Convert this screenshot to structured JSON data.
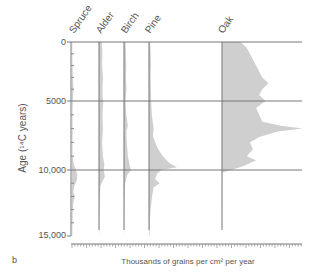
{
  "chart_data": {
    "type": "area",
    "title": "",
    "panel_label": "b",
    "xlabel": "Thousands of grains per cm² per year",
    "ylabel": "Age (¹⁴C years)",
    "y_ticks": [
      "0",
      "5000",
      "10,000",
      "15,000"
    ],
    "ylim": [
      0,
      15000
    ],
    "y_inverted": true,
    "grid": "horizontal lines at 0, 5000, 10,000",
    "fill_color": "#cfcfcf",
    "line_color": "#777777",
    "series": [
      {
        "name": "Spruce",
        "points": [
          [
            0,
            0.2
          ],
          [
            1000,
            0.2
          ],
          [
            2000,
            0.3
          ],
          [
            3000,
            0.5
          ],
          [
            4000,
            1.0
          ],
          [
            5000,
            0.5
          ],
          [
            6000,
            0.3
          ],
          [
            7000,
            0.4
          ],
          [
            8000,
            0.3
          ],
          [
            9000,
            0.4
          ],
          [
            9600,
            1.2
          ],
          [
            10000,
            2.5
          ],
          [
            10400,
            3.5
          ],
          [
            10800,
            3.0
          ],
          [
            11200,
            1.5
          ],
          [
            11700,
            0.8
          ],
          [
            12000,
            2.0
          ],
          [
            12400,
            1.0
          ],
          [
            13000,
            0.5
          ],
          [
            14000,
            0.3
          ],
          [
            15000,
            0.2
          ]
        ]
      },
      {
        "name": "Alder",
        "points": [
          [
            0,
            1.8
          ],
          [
            1000,
            2.2
          ],
          [
            2000,
            2.0
          ],
          [
            3000,
            2.6
          ],
          [
            4000,
            2.2
          ],
          [
            4800,
            2.4
          ],
          [
            5000,
            2.8
          ],
          [
            6000,
            2.2
          ],
          [
            7000,
            2.5
          ],
          [
            8000,
            2.0
          ],
          [
            9000,
            2.5
          ],
          [
            9600,
            3.5
          ],
          [
            10000,
            3.0
          ],
          [
            10500,
            3.8
          ],
          [
            10800,
            2.5
          ],
          [
            11200,
            1.0
          ],
          [
            12000,
            0.5
          ],
          [
            13000,
            0.3
          ],
          [
            14000,
            0.2
          ],
          [
            15000,
            0.1
          ]
        ]
      },
      {
        "name": "Birch",
        "points": [
          [
            0,
            1.0
          ],
          [
            1000,
            1.2
          ],
          [
            2000,
            1.5
          ],
          [
            3000,
            1.3
          ],
          [
            4000,
            1.6
          ],
          [
            5000,
            1.0
          ],
          [
            6000,
            1.5
          ],
          [
            6800,
            2.5
          ],
          [
            7200,
            1.5
          ],
          [
            8000,
            1.8
          ],
          [
            9000,
            2.5
          ],
          [
            9600,
            3.5
          ],
          [
            10000,
            4.5
          ],
          [
            10400,
            2.0
          ],
          [
            11000,
            0.8
          ],
          [
            12000,
            0.4
          ],
          [
            13000,
            0.2
          ],
          [
            15000,
            0.1
          ]
        ]
      },
      {
        "name": "Pine",
        "points": [
          [
            0,
            0.8
          ],
          [
            1000,
            1.0
          ],
          [
            2000,
            1.2
          ],
          [
            3000,
            1.0
          ],
          [
            4000,
            1.2
          ],
          [
            5000,
            1.4
          ],
          [
            6000,
            1.8
          ],
          [
            7000,
            3.0
          ],
          [
            7500,
            2.5
          ],
          [
            8000,
            4.0
          ],
          [
            8500,
            6.0
          ],
          [
            9000,
            9.0
          ],
          [
            9500,
            13.0
          ],
          [
            9800,
            18.0
          ],
          [
            10000,
            8.0
          ],
          [
            10300,
            5.0
          ],
          [
            10700,
            4.0
          ],
          [
            11000,
            7.0
          ],
          [
            11300,
            3.0
          ],
          [
            12000,
            2.0
          ],
          [
            13000,
            1.0
          ],
          [
            14000,
            0.5
          ],
          [
            15000,
            0.3
          ]
        ]
      },
      {
        "name": "Oak",
        "points": [
          [
            0,
            12.0
          ],
          [
            500,
            16.0
          ],
          [
            1000,
            18.0
          ],
          [
            1500,
            20.0
          ],
          [
            2000,
            22.0
          ],
          [
            2500,
            24.0
          ],
          [
            3000,
            26.0
          ],
          [
            3500,
            30.0
          ],
          [
            4000,
            26.0
          ],
          [
            4500,
            24.0
          ],
          [
            5000,
            28.0
          ],
          [
            5500,
            22.0
          ],
          [
            6000,
            24.0
          ],
          [
            6500,
            26.0
          ],
          [
            6800,
            38.0
          ],
          [
            7000,
            52.0
          ],
          [
            7200,
            36.0
          ],
          [
            7600,
            24.0
          ],
          [
            8000,
            18.0
          ],
          [
            8500,
            20.0
          ],
          [
            9000,
            16.0
          ],
          [
            9300,
            22.0
          ],
          [
            9700,
            14.0
          ],
          [
            10000,
            6.0
          ],
          [
            10200,
            0.2
          ],
          [
            15000,
            0.0
          ]
        ]
      }
    ]
  }
}
